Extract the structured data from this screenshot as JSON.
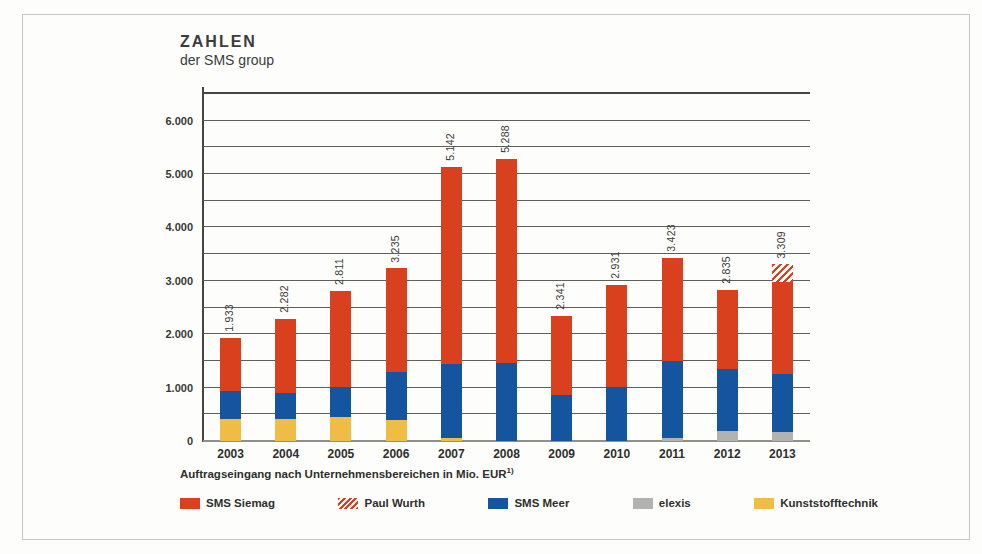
{
  "header": {
    "title": "ZAHLEN",
    "subtitle": "der SMS group"
  },
  "caption": {
    "text": "Auftragseingang nach Unternehmensbereichen in Mio. EUR",
    "footnote_marker": "1)"
  },
  "colors": {
    "sms_siemag": "#d9401e",
    "sms_meer": "#15559f",
    "elexis": "#b2b2b0",
    "kunststofftechnik": "#efbc45",
    "gridline": "#60605a",
    "frame_border": "#c6c6c3"
  },
  "legend": [
    {
      "label": "SMS Siemag",
      "color": "#d9401e",
      "hatched": false
    },
    {
      "label": "Paul Wurth",
      "color": "#d9401e",
      "hatched": true
    },
    {
      "label": "SMS Meer",
      "color": "#15559f",
      "hatched": false
    },
    {
      "label": "elexis",
      "color": "#b2b2b0",
      "hatched": false
    },
    {
      "label": "Kunststofftechnik",
      "color": "#efbc45",
      "hatched": false
    }
  ],
  "chart_data": {
    "type": "bar",
    "stacked": true,
    "title": "ZAHLEN der SMS group",
    "xlabel": "",
    "ylabel": "Auftragseingang nach Unternehmensbereichen in Mio. EUR",
    "categories": [
      "2003",
      "2004",
      "2005",
      "2006",
      "2007",
      "2008",
      "2009",
      "2010",
      "2011",
      "2012",
      "2013"
    ],
    "series": [
      {
        "name": "Kunststofftechnik",
        "color": "#efbc45",
        "hatched": false,
        "values": [
          420,
          420,
          455,
          400,
          50,
          0,
          0,
          0,
          0,
          0,
          0
        ]
      },
      {
        "name": "elexis",
        "color": "#b2b2b0",
        "hatched": false,
        "values": [
          0,
          0,
          0,
          0,
          0,
          0,
          0,
          0,
          50,
          190,
          165
        ]
      },
      {
        "name": "SMS Meer",
        "color": "#15559f",
        "hatched": false,
        "values": [
          515,
          480,
          565,
          890,
          1390,
          1460,
          870,
          1020,
          1440,
          1160,
          1095
        ]
      },
      {
        "name": "SMS Siemag",
        "color": "#d9401e",
        "hatched": false,
        "values": [
          998,
          1382,
          1791,
          1945,
          3702,
          3828,
          1471,
          1911,
          1933,
          1485,
          1710
        ]
      },
      {
        "name": "Paul Wurth",
        "color": "#d9401e",
        "hatched": true,
        "values": [
          0,
          0,
          0,
          0,
          0,
          0,
          0,
          0,
          0,
          0,
          339
        ]
      }
    ],
    "totals": [
      1933,
      2282,
      2811,
      3235,
      5142,
      5288,
      2341,
      2931,
      3423,
      2835,
      3309
    ],
    "totals_formatted": [
      "1.933",
      "2.282",
      "2.811",
      "3.235",
      "5.142",
      "5.288",
      "2.341",
      "2.931",
      "3.423",
      "2.835",
      "3.309"
    ],
    "ylim": [
      0,
      6500
    ],
    "ytick_step": 500,
    "ylabel_step": 1000,
    "ytick_labels": [
      "0",
      "1.000",
      "2.000",
      "3.000",
      "4.000",
      "5.000",
      "6.000"
    ],
    "grid": true,
    "legend_position": "bottom"
  }
}
